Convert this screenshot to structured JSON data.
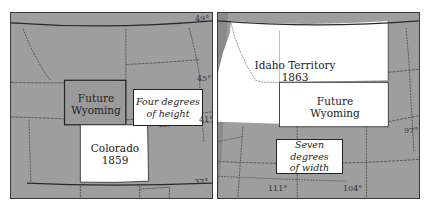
{
  "colors": {
    "background": "#ffffff",
    "land_gray": "#9e9e9e",
    "highlight_white": "#ffffff",
    "border_dark": "#2a2a2a",
    "dashed_border": "#555555"
  },
  "left_map": {
    "regions": {
      "future_wyoming": {
        "line1": "Future",
        "line2": "Wyoming"
      },
      "colorado": {
        "line1": "Colorado",
        "line2": "1859"
      }
    },
    "callout": {
      "line1": "Four degrees",
      "line2": "of height"
    },
    "latitude_labels": [
      "49°",
      "45°",
      "41°",
      "37°"
    ]
  },
  "right_map": {
    "regions": {
      "idaho_territory": {
        "line1": "Idaho Territory",
        "line2": "1863"
      },
      "future_wyoming": {
        "line1": "Future",
        "line2": "Wyoming"
      }
    },
    "callout": {
      "line1": "Seven degrees",
      "line2": "of width"
    },
    "longitude_labels": [
      "111°",
      "104°"
    ],
    "meridian_label": "97°"
  }
}
